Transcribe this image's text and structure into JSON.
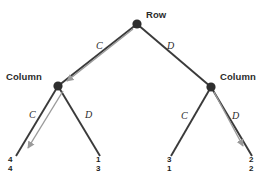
{
  "diagram": {
    "type": "extensive-form-game-tree",
    "title_visible": false,
    "colors": {
      "edge": "#3a3a3a",
      "highlight_arrow": "#9a9a9a",
      "node_fill": "#2e2e2e",
      "text": "#2b2b2b",
      "background": "#ffffff"
    },
    "nodes": [
      {
        "id": "root",
        "player": "Row",
        "x": 137,
        "y": 24,
        "label_dx": 9,
        "label_dy": -14,
        "label_align": "left"
      },
      {
        "id": "left_column",
        "player": "Column",
        "x": 58,
        "y": 86,
        "label_dx": -52,
        "label_dy": -14,
        "label_align": "left"
      },
      {
        "id": "right_column",
        "player": "Column",
        "x": 211,
        "y": 87,
        "label_dx": 9,
        "label_dy": -15,
        "label_align": "left"
      }
    ],
    "edges": [
      {
        "from": "root",
        "to": "left_column",
        "action": "C",
        "label_x": 96,
        "label_y": 41,
        "highlighted": true
      },
      {
        "from": "root",
        "to": "right_column",
        "action": "D",
        "label_x": 167,
        "label_y": 41,
        "highlighted": false
      },
      {
        "from": "left_column",
        "to": "leaf_cc",
        "action": "C",
        "label_x": 29,
        "label_y": 110,
        "highlighted": true
      },
      {
        "from": "left_column",
        "to": "leaf_cd",
        "action": "D",
        "label_x": 85,
        "label_y": 110,
        "highlighted": false
      },
      {
        "from": "right_column",
        "to": "leaf_dc",
        "action": "C",
        "label_x": 181,
        "label_y": 111,
        "highlighted": false
      },
      {
        "from": "right_column",
        "to": "leaf_dd",
        "action": "D",
        "label_x": 232,
        "label_y": 111,
        "highlighted": true
      }
    ],
    "leaves": [
      {
        "id": "leaf_cc",
        "x": 14,
        "y": 155,
        "row_payoff": "4",
        "column_payoff": "4",
        "highlighted": true
      },
      {
        "id": "leaf_cd",
        "x": 99,
        "y": 155,
        "row_payoff": "1",
        "column_payoff": "3",
        "highlighted": false
      },
      {
        "id": "leaf_dc",
        "x": 170,
        "y": 155,
        "row_payoff": "3",
        "column_payoff": "1",
        "highlighted": false
      },
      {
        "id": "leaf_dd",
        "x": 253,
        "y": 155,
        "row_payoff": "2",
        "column_payoff": "2",
        "highlighted": true
      }
    ],
    "solution_arrows": [
      {
        "from": "root",
        "to": "left_column"
      },
      {
        "from": "left_column",
        "to": "leaf_cc"
      },
      {
        "from": "right_column",
        "to": "leaf_dd"
      }
    ]
  }
}
